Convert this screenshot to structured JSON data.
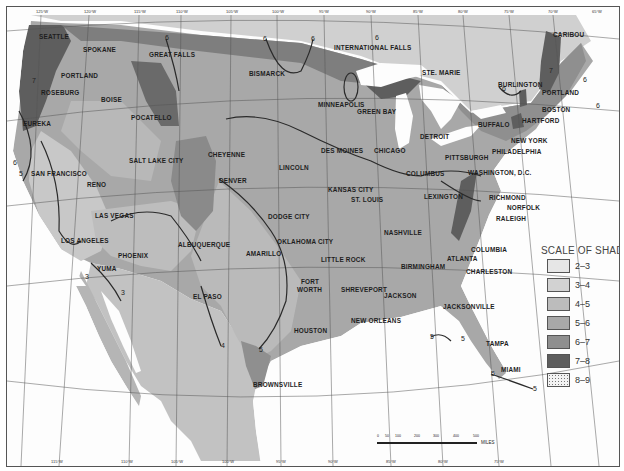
{
  "map": {
    "type": "shaded-isoline-map",
    "region": "Contiguous United States and northern Mexico",
    "colors": {
      "water": "#fdfdfd",
      "shade_2_3": "#e6e6e6",
      "shade_3_4": "#d2d2d2",
      "shade_4_5": "#bcbcbc",
      "shade_5_6": "#a8a8a8",
      "shade_6_7": "#8f8f8f",
      "shade_7_8": "#5e5e5e",
      "shade_8_9": "#eeeeee",
      "contour": "#2a2a2a",
      "grid": "#555555"
    }
  },
  "legend": {
    "title": "SCALE OF SHADES",
    "items": [
      {
        "label": "2–3",
        "color": "#e6e6e6"
      },
      {
        "label": "3–4",
        "color": "#d2d2d2"
      },
      {
        "label": "4–5",
        "color": "#bcbcbc"
      },
      {
        "label": "5–6",
        "color": "#a8a8a8"
      },
      {
        "label": "6–7",
        "color": "#8f8f8f"
      },
      {
        "label": "7–8",
        "color": "#5e5e5e"
      },
      {
        "label": "8–9",
        "color": "#eeeeee",
        "pattern": "dotted"
      }
    ]
  },
  "scale_bar": {
    "ticks": [
      "0",
      "50",
      "100",
      "200",
      "300",
      "400",
      "500"
    ],
    "unit": "MILES"
  },
  "top_ticks": [
    "125°W",
    "120°W",
    "115°W",
    "110°W",
    "105°W",
    "100°W",
    "95°W",
    "90°W",
    "85°W",
    "80°W",
    "75°W",
    "70°W",
    "65°W"
  ],
  "bottom_ticks": [
    "115°W",
    "110°W",
    "105°W",
    "100°W",
    "95°W",
    "90°W",
    "85°W",
    "80°W",
    "75°W"
  ],
  "left_ticks": [
    "45°N",
    "40°N",
    "35°N",
    "30°N",
    "25°N"
  ],
  "right_ticks": [
    "45°N",
    "40°N",
    "35°N",
    "30°N",
    "25°N"
  ],
  "cities": [
    {
      "name": "SEATTLE",
      "x": 38,
      "y": 36
    },
    {
      "name": "SPOKANE",
      "x": 82,
      "y": 49
    },
    {
      "name": "GREAT FALLS",
      "x": 148,
      "y": 54
    },
    {
      "name": "PORTLAND",
      "x": 60,
      "y": 75
    },
    {
      "name": "ROSEBURG",
      "x": 40,
      "y": 92
    },
    {
      "name": "BOISE",
      "x": 100,
      "y": 99
    },
    {
      "name": "POCATELLO",
      "x": 130,
      "y": 117
    },
    {
      "name": "EUREKA",
      "x": 22,
      "y": 123
    },
    {
      "name": "SALT LAKE CITY",
      "x": 128,
      "y": 160
    },
    {
      "name": "SAN FRANCISCO",
      "x": 30,
      "y": 173
    },
    {
      "name": "RENO",
      "x": 86,
      "y": 184
    },
    {
      "name": "CHEYENNE",
      "x": 207,
      "y": 154
    },
    {
      "name": "DENVER",
      "x": 218,
      "y": 180
    },
    {
      "name": "LAS VEGAS",
      "x": 94,
      "y": 215
    },
    {
      "name": "LOS ANGELES",
      "x": 60,
      "y": 240
    },
    {
      "name": "ALBUQUERQUE",
      "x": 177,
      "y": 244
    },
    {
      "name": "PHOENIX",
      "x": 117,
      "y": 255
    },
    {
      "name": "YUMA",
      "x": 96,
      "y": 268
    },
    {
      "name": "EL PASO",
      "x": 192,
      "y": 296
    },
    {
      "name": "BISMARCK",
      "x": 248,
      "y": 73
    },
    {
      "name": "INTERNATIONAL FALLS",
      "x": 333,
      "y": 47
    },
    {
      "name": "MINNEAPOLIS",
      "x": 317,
      "y": 104
    },
    {
      "name": "GREEN BAY",
      "x": 356,
      "y": 111
    },
    {
      "name": "STE. MARIE",
      "x": 421,
      "y": 72
    },
    {
      "name": "DES MOINES",
      "x": 320,
      "y": 150
    },
    {
      "name": "LINCOLN",
      "x": 278,
      "y": 167
    },
    {
      "name": "CHICAGO",
      "x": 373,
      "y": 150
    },
    {
      "name": "KANSAS CITY",
      "x": 327,
      "y": 189
    },
    {
      "name": "ST. LOUIS",
      "x": 350,
      "y": 199
    },
    {
      "name": "DODGE CITY",
      "x": 267,
      "y": 216
    },
    {
      "name": "OKLAHOMA CITY",
      "x": 276,
      "y": 241
    },
    {
      "name": "AMARILLO",
      "x": 245,
      "y": 253
    },
    {
      "name": "FORT",
      "x": 300,
      "y": 281
    },
    {
      "name": "WORTH",
      "x": 296,
      "y": 289
    },
    {
      "name": "LITTLE ROCK",
      "x": 320,
      "y": 259
    },
    {
      "name": "SHREVEPORT",
      "x": 340,
      "y": 289
    },
    {
      "name": "HOUSTON",
      "x": 293,
      "y": 330
    },
    {
      "name": "NEW ORLEANS",
      "x": 350,
      "y": 320
    },
    {
      "name": "BROWNSVILLE",
      "x": 252,
      "y": 384
    },
    {
      "name": "JACKSON",
      "x": 383,
      "y": 295
    },
    {
      "name": "BIRMINGHAM",
      "x": 400,
      "y": 266
    },
    {
      "name": "NASHVILLE",
      "x": 383,
      "y": 232
    },
    {
      "name": "ATLANTA",
      "x": 446,
      "y": 258
    },
    {
      "name": "COLUMBIA",
      "x": 470,
      "y": 249
    },
    {
      "name": "CHARLESTON",
      "x": 465,
      "y": 271
    },
    {
      "name": "JACKSONVILLE",
      "x": 442,
      "y": 306
    },
    {
      "name": "TAMPA",
      "x": 485,
      "y": 343
    },
    {
      "name": "MIAMI",
      "x": 500,
      "y": 369
    },
    {
      "name": "LEXINGTON",
      "x": 423,
      "y": 196
    },
    {
      "name": "COLUMBUS",
      "x": 405,
      "y": 173
    },
    {
      "name": "DETROIT",
      "x": 419,
      "y": 136
    },
    {
      "name": "PITTSBURGH",
      "x": 444,
      "y": 157
    },
    {
      "name": "BUFFALO",
      "x": 477,
      "y": 124
    },
    {
      "name": "WASHINGTON, D.C.",
      "x": 467,
      "y": 172
    },
    {
      "name": "RICHMOND",
      "x": 488,
      "y": 197
    },
    {
      "name": "NORFOLK",
      "x": 506,
      "y": 207
    },
    {
      "name": "RALEIGH",
      "x": 495,
      "y": 218
    },
    {
      "name": "PHILADELPHIA",
      "x": 491,
      "y": 151
    },
    {
      "name": "NEW YORK",
      "x": 510,
      "y": 140
    },
    {
      "name": "HARTFORD",
      "x": 521,
      "y": 120
    },
    {
      "name": "BOSTON",
      "x": 541,
      "y": 109
    },
    {
      "name": "PORTLAND",
      "x": 541,
      "y": 92
    },
    {
      "name": "BURLINGTON",
      "x": 497,
      "y": 84
    },
    {
      "name": "CARIBOU",
      "x": 552,
      "y": 34
    }
  ],
  "contour_labels": [
    {
      "text": "7",
      "x": 31,
      "y": 80
    },
    {
      "text": "6",
      "x": 12,
      "y": 162
    },
    {
      "text": "5",
      "x": 18,
      "y": 173
    },
    {
      "text": "6",
      "x": 164,
      "y": 37
    },
    {
      "text": "6",
      "x": 262,
      "y": 38
    },
    {
      "text": "6",
      "x": 310,
      "y": 38
    },
    {
      "text": "6",
      "x": 374,
      "y": 37
    },
    {
      "text": "6",
      "x": 501,
      "y": 88
    },
    {
      "text": "7",
      "x": 548,
      "y": 70
    },
    {
      "text": "6",
      "x": 582,
      "y": 79
    },
    {
      "text": "6",
      "x": 595,
      "y": 105
    },
    {
      "text": "3",
      "x": 84,
      "y": 276
    },
    {
      "text": "3",
      "x": 120,
      "y": 292
    },
    {
      "text": "4",
      "x": 220,
      "y": 345
    },
    {
      "text": "5",
      "x": 258,
      "y": 349
    },
    {
      "text": "5",
      "x": 429,
      "y": 336
    },
    {
      "text": "5",
      "x": 460,
      "y": 338
    },
    {
      "text": "5",
      "x": 490,
      "y": 373
    },
    {
      "text": "5",
      "x": 532,
      "y": 388
    }
  ]
}
